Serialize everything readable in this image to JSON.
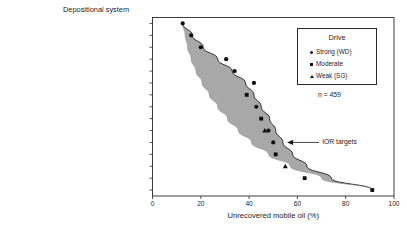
{
  "chart_data": {
    "type": "scatter",
    "title": "",
    "ylabel": "Depositional system",
    "xlabel": "Unrecovered mobile oil (%)",
    "xlim": [
      0,
      100
    ],
    "xticks": [
      0,
      20,
      40,
      60,
      80,
      100
    ],
    "grid": false,
    "categories": [
      "Strandplain/wave-dominated deltas",
      "Large barrier bars",
      "Large reefs and atolls",
      "Fluvial/wave-modified deltas",
      "Carbonate ramps",
      "Back-barrier",
      "Carbonate platforms",
      "Wave-dominated deltas",
      "Fan delta (and sand-rich submarine fans)",
      "Fluvial systems",
      "Fluvially dominated deltas",
      "Restricted-platform carbonates",
      "Platform-margin carbonates",
      "Turbidites",
      "Mud-rich submarine-fan turbidites"
    ],
    "series": [
      {
        "name": "Strong (WD)",
        "marker": "circle",
        "points": [
          {
            "category": "Strandplain/wave-dominated deltas",
            "x": 12.5
          },
          {
            "category": "Large barrier bars",
            "x": 16.0
          },
          {
            "category": "Large reefs and atolls",
            "x": 20.0
          },
          {
            "category": "Fluvial/wave-modified deltas",
            "x": 30.5
          },
          {
            "category": "Carbonate ramps",
            "x": 34.0
          },
          {
            "category": "Back-barrier",
            "x": 42.0
          },
          {
            "category": "Wave-dominated deltas",
            "x": 43.0
          },
          {
            "category": "Fluvial systems",
            "x": 48.0
          },
          {
            "category": "Fluvially dominated deltas",
            "x": 50.0
          }
        ]
      },
      {
        "name": "Moderate",
        "marker": "square",
        "points": [
          {
            "category": "Carbonate platforms",
            "x": 39.0
          },
          {
            "category": "Fan delta (and sand-rich submarine fans)",
            "x": 45.0
          },
          {
            "category": "Restricted-platform carbonates",
            "x": 51.0
          },
          {
            "category": "Turbidites",
            "x": 63.0
          },
          {
            "category": "Mud-rich submarine-fan turbidites",
            "x": 91.0
          }
        ]
      },
      {
        "name": "Weak (SG)",
        "marker": "triangle",
        "points": [
          {
            "category": "Fluvial systems",
            "x": 46.5
          },
          {
            "category": "Platform-margin carbonates",
            "x": 55.0
          }
        ]
      }
    ],
    "band": {
      "description": "shaded envelope between upper and lower bounding curves",
      "fill_color": "#a8a8a8",
      "upper_bound": [
        {
          "category": "Strandplain/wave-dominated deltas",
          "x": 12.5
        },
        {
          "category": "Large barrier bars",
          "x": 16.5
        },
        {
          "category": "Large reefs and atolls",
          "x": 21.0
        },
        {
          "category": "Fluvial/wave-modified deltas",
          "x": 27.0
        },
        {
          "category": "Carbonate ramps",
          "x": 33.0
        },
        {
          "category": "Back-barrier",
          "x": 38.5
        },
        {
          "category": "Carbonate platforms",
          "x": 42.0
        },
        {
          "category": "Wave-dominated deltas",
          "x": 45.0
        },
        {
          "category": "Fan delta (and sand-rich submarine fans)",
          "x": 48.5
        },
        {
          "category": "Fluvial systems",
          "x": 51.0
        },
        {
          "category": "Fluvially dominated deltas",
          "x": 54.0
        },
        {
          "category": "Restricted-platform carbonates",
          "x": 58.0
        },
        {
          "category": "Platform-margin carbonates",
          "x": 64.0
        },
        {
          "category": "Turbidites",
          "x": 74.0
        },
        {
          "category": "Mud-rich submarine-fan turbidites",
          "x": 91.0
        }
      ],
      "lower_bound": [
        {
          "category": "Strandplain/wave-dominated deltas",
          "x": 12.5
        },
        {
          "category": "Large barrier bars",
          "x": 13.5
        },
        {
          "category": "Large reefs and atolls",
          "x": 14.5
        },
        {
          "category": "Fluvial/wave-modified deltas",
          "x": 16.0
        },
        {
          "category": "Carbonate ramps",
          "x": 18.0
        },
        {
          "category": "Back-barrier",
          "x": 20.5
        },
        {
          "category": "Carbonate platforms",
          "x": 23.5
        },
        {
          "category": "Wave-dominated deltas",
          "x": 27.0
        },
        {
          "category": "Fan delta (and sand-rich submarine fans)",
          "x": 31.0
        },
        {
          "category": "Fluvial systems",
          "x": 35.5
        },
        {
          "category": "Fluvially dominated deltas",
          "x": 41.0
        },
        {
          "category": "Restricted-platform carbonates",
          "x": 48.0
        },
        {
          "category": "Platform-margin carbonates",
          "x": 57.0
        },
        {
          "category": "Turbidites",
          "x": 70.0
        },
        {
          "category": "Mud-rich submarine-fan turbidites",
          "x": 91.0
        }
      ]
    },
    "annotations": [
      {
        "text": "IOR targets",
        "x": 69.0,
        "category": "Fluvially dominated deltas",
        "arrow": "left"
      }
    ]
  },
  "legend": {
    "title": "Drive",
    "entries": [
      {
        "label": "Strong (WD)",
        "marker": "circle"
      },
      {
        "label": "Moderate",
        "marker": "square"
      },
      {
        "label": "Weak (SG)",
        "marker": "triangle"
      }
    ],
    "sample_size": "n = 459"
  }
}
